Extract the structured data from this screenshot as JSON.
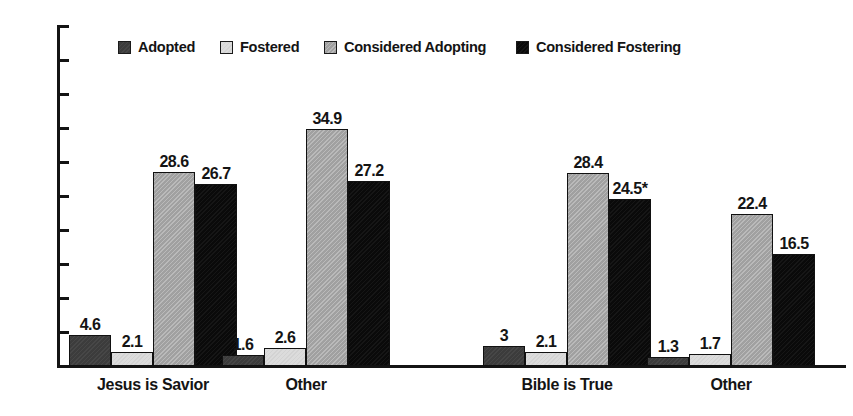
{
  "chart_data": {
    "type": "bar",
    "title": "",
    "subtitle": "",
    "xlabel": "",
    "ylabel": "",
    "ylim": [
      0,
      50
    ],
    "ytick_step": 5,
    "yticks": [
      "50",
      "45",
      "40",
      "35",
      "30",
      "25",
      "20",
      "15",
      "10",
      "5",
      "0"
    ],
    "grid": false,
    "legend_position": "top",
    "categories": [
      "Jesus is Savior",
      "Other",
      "Bible is True",
      "Other"
    ],
    "series": [
      {
        "name": "Adopted",
        "color": "#3c3c3c",
        "values": [
          4.6,
          1.6,
          3,
          1.3
        ],
        "labels": [
          "4.6",
          "1.6",
          "3",
          "1.3"
        ]
      },
      {
        "name": "Fostered",
        "color": "#dcdcdc",
        "values": [
          2.1,
          2.6,
          2.1,
          1.7
        ],
        "labels": [
          "2.1",
          "2.6",
          "2.1",
          "1.7"
        ]
      },
      {
        "name": "Considered Adopting",
        "color": "#a9a9a9",
        "values": [
          28.6,
          34.9,
          28.4,
          22.4
        ],
        "labels": [
          "28.6",
          "34.9",
          "28.4",
          "22.4"
        ]
      },
      {
        "name": "Considered Fostering",
        "color": "#0a0a0a",
        "values": [
          26.7,
          27.2,
          24.5,
          16.5
        ],
        "labels": [
          "26.7",
          "27.2",
          "24.5*",
          "16.5"
        ]
      }
    ],
    "annotations": [
      "*"
    ],
    "axis_color": "#141414",
    "background_color": "#ffffff"
  },
  "legend": {
    "items": [
      {
        "label": "Adopted",
        "color": "#3c3c3c"
      },
      {
        "label": "Fostered",
        "color": "#dcdcdc"
      },
      {
        "label": "Considered Adopting",
        "color": "#a9a9a9"
      },
      {
        "label": "Considered Fostering",
        "color": "#0a0a0a"
      }
    ]
  }
}
